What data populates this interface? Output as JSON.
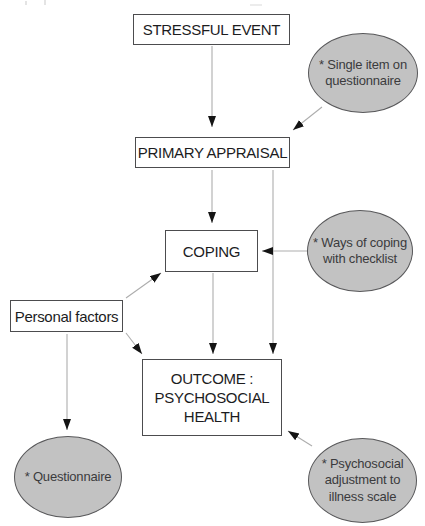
{
  "diagram": {
    "nodes": {
      "stressful_event": {
        "label": "STRESSFUL EVENT"
      },
      "primary_appraisal": {
        "label": "PRIMARY APPRAISAL"
      },
      "coping": {
        "label": "COPING"
      },
      "personal_factors": {
        "label": "Personal factors"
      },
      "outcome": {
        "line1": "OUTCOME :",
        "line2": "PSYCHOSOCIAL",
        "line3": "HEALTH"
      }
    },
    "measures": {
      "single_item": {
        "line1": "* Single item on",
        "line2": "questionnaire"
      },
      "ways_of_coping": {
        "line1": "* Ways of coping",
        "line2": "with checklist"
      },
      "questionnaire": {
        "line1": "* Questionnaire"
      },
      "psychosocial_adjustment": {
        "line1": "* Psychosocial",
        "line2": "adjustment to",
        "line3": "illness scale"
      }
    },
    "edges": [
      {
        "from": "STRESSFUL EVENT",
        "to": "PRIMARY APPRAISAL"
      },
      {
        "from": "* Single item on questionnaire",
        "to": "PRIMARY APPRAISAL"
      },
      {
        "from": "PRIMARY APPRAISAL",
        "to": "COPING"
      },
      {
        "from": "PRIMARY APPRAISAL",
        "to": "OUTCOME : PSYCHOSOCIAL HEALTH"
      },
      {
        "from": "* Ways of coping with checklist",
        "to": "COPING"
      },
      {
        "from": "Personal factors",
        "to": "COPING"
      },
      {
        "from": "Personal factors",
        "to": "OUTCOME : PSYCHOSOCIAL HEALTH"
      },
      {
        "from": "Personal factors",
        "to": "* Questionnaire"
      },
      {
        "from": "COPING",
        "to": "OUTCOME : PSYCHOSOCIAL HEALTH"
      },
      {
        "from": "* Psychosocial adjustment to illness scale",
        "to": "OUTCOME : PSYCHOSOCIAL HEALTH"
      }
    ],
    "colors": {
      "background": "#ffffff",
      "ellipse_fill": "#c2c2c2",
      "ellipse_border": "#58585a",
      "ellipse_text": "#3b3b3d",
      "box_fill": "#ffffff",
      "box_border": "#4c4c4e",
      "box_text": "#1c1c1e",
      "connector_line": "#adadad",
      "arrowhead": "#141414"
    }
  }
}
